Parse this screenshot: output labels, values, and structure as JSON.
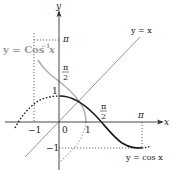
{
  "diagram": {
    "title": "",
    "axes": {
      "x_label": "x",
      "y_label": "y",
      "origin_label": "0"
    },
    "tick_labels": {
      "x_neg_one": "−1",
      "x_one": "1",
      "x_pi_half_num": "π",
      "x_pi_half_den": "2",
      "x_pi": "π",
      "y_one": "1",
      "y_neg_one": "−1",
      "y_pi_half_num": "π",
      "y_pi_half_den": "2",
      "y_pi": "π"
    },
    "curves": {
      "cos": {
        "label": "y = cos x",
        "color": "#1a1a1a"
      },
      "arccos": {
        "label_main": "y = Cos",
        "label_sup": "−1",
        "label_var": "x",
        "color": "#a8a8a8"
      },
      "identity": {
        "label": "y = x",
        "color": "#808080"
      }
    },
    "colors": {
      "axis": "#333333",
      "guide": "#555555",
      "background": "#ffffff"
    }
  }
}
